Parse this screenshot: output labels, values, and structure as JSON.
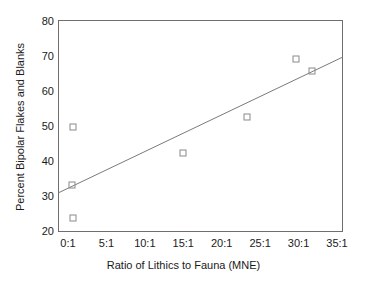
{
  "chart_data": {
    "type": "scatter",
    "title": "",
    "xlabel": "Ratio of Lithics to Fauna (MNE)",
    "ylabel": "Percent Bipolar Flakes and Blanks",
    "xlim": [
      0,
      35
    ],
    "ylim": [
      20,
      80
    ],
    "grid": false,
    "legend": null,
    "xticklabels": [
      "0:1",
      "5:1",
      "10:1",
      "15:1",
      "20:1",
      "25:1",
      "30:1",
      "35:1"
    ],
    "xtickvalues": [
      0,
      5,
      10,
      15,
      20,
      25,
      30,
      35
    ],
    "yticklabels": [
      "20",
      "30",
      "40",
      "50",
      "60",
      "70",
      "80"
    ],
    "ytickvalues": [
      20,
      30,
      40,
      50,
      60,
      70,
      80
    ],
    "marker": "open-square",
    "points": [
      {
        "x": 0.6,
        "y": 50.1
      },
      {
        "x": 0.5,
        "y": 33.4
      },
      {
        "x": 0.6,
        "y": 23.9
      },
      {
        "x": 15.0,
        "y": 42.6
      },
      {
        "x": 23.3,
        "y": 52.9
      },
      {
        "x": 29.7,
        "y": 69.5
      },
      {
        "x": 31.8,
        "y": 66.1
      }
    ],
    "trendline": {
      "type": "linear-fit",
      "x_start": 0,
      "y_start": 32.5,
      "x_end": 35,
      "y_end": 69.2
    },
    "colors": {
      "marker_stroke": "#8a8a8a",
      "trendline": "#7a7a7a",
      "frame": "#6e6e6e",
      "text": "#1a1a1a",
      "background": "#ffffff"
    }
  }
}
